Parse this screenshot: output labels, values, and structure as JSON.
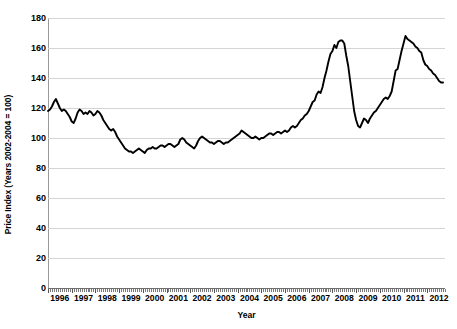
{
  "chart_data": {
    "type": "line",
    "title": "",
    "subtitle": "",
    "xlabel": "Year",
    "ylabel": "Price Index (Years 2002-2004 = 100)",
    "xlim": [
      1996.0,
      2012.75
    ],
    "ylim": [
      0,
      180
    ],
    "ytick_step": 20,
    "yticks": [
      0,
      20,
      40,
      60,
      80,
      100,
      120,
      140,
      160,
      180
    ],
    "ytick_labels": [
      "0",
      "20",
      "40",
      "60",
      "80",
      "100",
      "120",
      "140",
      "160",
      "180"
    ],
    "xticks": [
      1996,
      1997,
      1998,
      1999,
      2000,
      2001,
      2002,
      2003,
      2004,
      2005,
      2006,
      2007,
      2008,
      2009,
      2010,
      2011,
      2012
    ],
    "xtick_labels": [
      "1996",
      "1997",
      "1998",
      "1999",
      "2000",
      "2001",
      "2002",
      "2003",
      "2004",
      "2005",
      "2006",
      "2007",
      "2008",
      "2009",
      "2010",
      "2011",
      "2012"
    ],
    "grid": {
      "horizontal": true,
      "vertical": false,
      "color": "#d4d4d4"
    },
    "legend": {
      "visible": false,
      "position": "none"
    },
    "line_color": "#000000",
    "line_width": 1.9,
    "x_start": 1996.0,
    "x_step_months": 1,
    "series": [
      {
        "name": "Price Index",
        "values": [
          118,
          119,
          121,
          124,
          126,
          123,
          120,
          118,
          119,
          118,
          116,
          114,
          111,
          110,
          113,
          117,
          119,
          118,
          116,
          117,
          116,
          118,
          117,
          115,
          116,
          118,
          117,
          115,
          112,
          110,
          108,
          106,
          105,
          106,
          104,
          101,
          99,
          97,
          95,
          93,
          92,
          91,
          91,
          90,
          91,
          92,
          93,
          92,
          91,
          90,
          92,
          93,
          93,
          94,
          93,
          93,
          94,
          95,
          95,
          94,
          95,
          96,
          96,
          95,
          94,
          95,
          96,
          99,
          100,
          99,
          97,
          96,
          95,
          94,
          93,
          95,
          98,
          100,
          101,
          100,
          99,
          98,
          97,
          97,
          96,
          97,
          98,
          98,
          97,
          96,
          97,
          97,
          98,
          99,
          100,
          101,
          102,
          103,
          105,
          104,
          103,
          102,
          101,
          100,
          100,
          101,
          100,
          99,
          100,
          100,
          101,
          102,
          103,
          103,
          102,
          103,
          104,
          104,
          103,
          104,
          105,
          104,
          105,
          107,
          108,
          107,
          108,
          110,
          112,
          113,
          115,
          116,
          118,
          121,
          124,
          125,
          129,
          131,
          130,
          134,
          140,
          145,
          151,
          156,
          158,
          162,
          160,
          164,
          165,
          165,
          163,
          155,
          148,
          138,
          128,
          118,
          112,
          108,
          107,
          110,
          113,
          112,
          110,
          113,
          115,
          117,
          118,
          120,
          122,
          124,
          126,
          127,
          126,
          128,
          131,
          138,
          145,
          146,
          152,
          158,
          163,
          168,
          166,
          165,
          164,
          163,
          161,
          160,
          158,
          157,
          152,
          149,
          148,
          146,
          145,
          143,
          142,
          140,
          138,
          137,
          137
        ]
      }
    ]
  },
  "axes": {
    "y_title": "Price Index (Years 2002-2004 = 100)",
    "x_title": "Year"
  }
}
